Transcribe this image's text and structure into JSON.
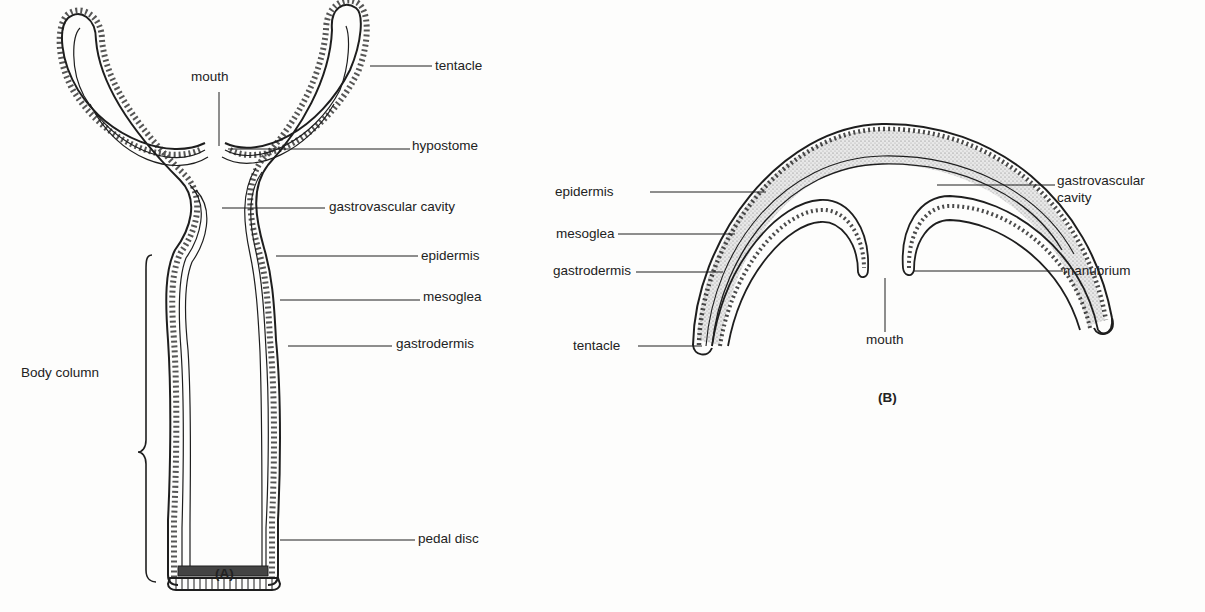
{
  "figure_a": {
    "caption": "(A)",
    "labels": {
      "mouth": "mouth",
      "tentacle": "tentacle",
      "hypostome": "hypostome",
      "gastrovascular_cavity": "gastrovascular cavity",
      "epidermis": "epidermis",
      "mesoglea": "mesoglea",
      "gastrodermis": "gastrodermis",
      "body_column": "Body column",
      "pedal_disc": "pedal disc"
    }
  },
  "figure_b": {
    "caption": "(B)",
    "labels": {
      "epidermis": "epidermis",
      "mesoglea": "mesoglea",
      "gastrodermis": "gastrodermis",
      "tentacle": "tentacle",
      "gastrovascular_cavity_line1": "gastrovascular",
      "gastrovascular_cavity_line2": "cavity",
      "manubrium": "manubrium",
      "mouth": "mouth"
    }
  },
  "colors": {
    "ink": "#1e1e1e",
    "background": "#fdfdfc",
    "mesoglea_stipple": "#b9b9b9"
  }
}
